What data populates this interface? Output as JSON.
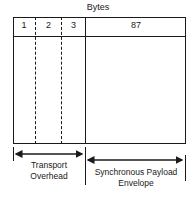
{
  "diagram": {
    "title": "Bytes",
    "columns": [
      {
        "label": "1"
      },
      {
        "label": "2"
      },
      {
        "label": "3"
      },
      {
        "label": "87"
      }
    ],
    "sections": [
      {
        "label_line1": "Transport",
        "label_line2": "Overhead"
      },
      {
        "label_line1": "Synchronous Payload",
        "label_line2": "Envelope"
      }
    ]
  }
}
